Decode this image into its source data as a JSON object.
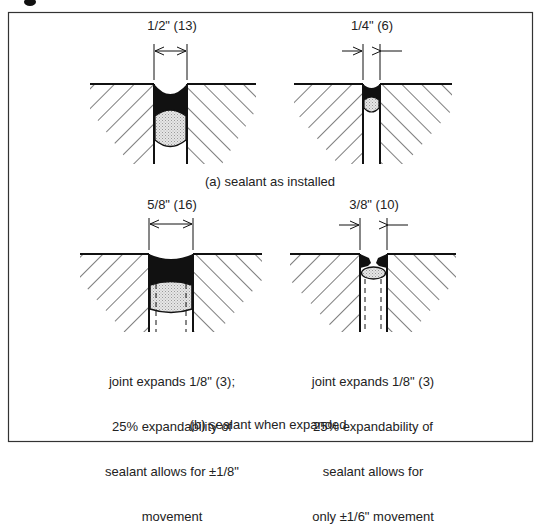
{
  "figure": {
    "background": "#ffffff",
    "ink": "#111111",
    "sealant_fill": "#111111",
    "backer_fill": "#d8d8d8"
  },
  "section_a": {
    "caption": "(a) sealant as installed",
    "joints": [
      {
        "id": "a-left",
        "dimension_label": "1/2\" (13)",
        "arrow_style": "inside"
      },
      {
        "id": "a-right",
        "dimension_label": "1/4\" (6)",
        "arrow_style": "outside"
      }
    ]
  },
  "section_b": {
    "caption": "(b) sealant when expanded",
    "joints": [
      {
        "id": "b-left",
        "dimension_label": "5/8\" (16)",
        "arrow_style": "inside",
        "note_lines": [
          "joint expands 1/8\" (3);",
          "25% expandability of",
          "sealant allows for ±1/8\"",
          "movement"
        ]
      },
      {
        "id": "b-right",
        "dimension_label": "3/8\" (10)",
        "arrow_style": "outside",
        "note_lines": [
          "joint expands 1/8\" (3)",
          "25% expandability of",
          "sealant allows for",
          "only ±1/6\" movement"
        ]
      }
    ]
  }
}
